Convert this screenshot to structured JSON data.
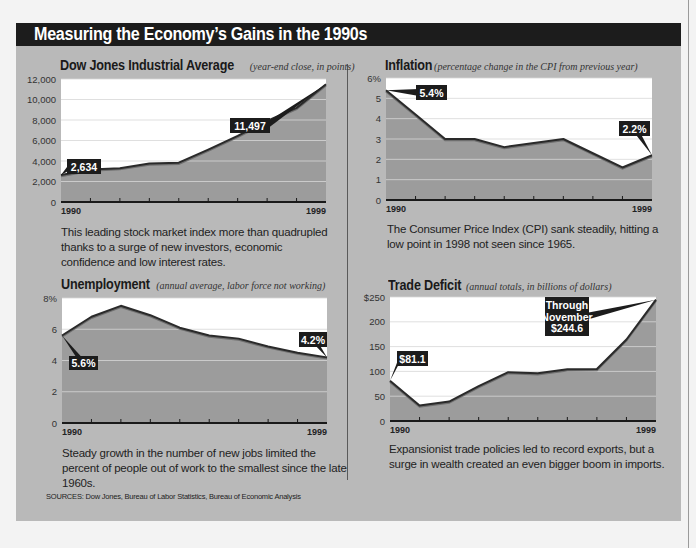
{
  "title": "Measuring the Economy’s Gains in the 1990s",
  "sources": "SOURCES: Dow Jones, Bureau of Labor Statistics, Bureau of Economic Analysis",
  "colors": {
    "panel_bg": "#b9b9b9",
    "title_bar": "#1c1c1c",
    "plot_bg": "#ffffff",
    "area_fill": "#9c9c9c",
    "line": "#2a2a2a",
    "callout_bg": "#1c1c1c",
    "callout_text": "#ffffff"
  },
  "charts": {
    "dow": {
      "heading": "Dow Jones Industrial Average",
      "subheading": "(year-end close, in points)",
      "caption": "This leading stock market index more than quadrupled thanks to a surge of new investors, economic confidence and low interest rates.",
      "x_start_label": "1990",
      "x_end_label": "1999",
      "y_ticks": [
        "0",
        "2,000",
        "4,000",
        "6,000",
        "8,000",
        "10,000",
        "12,000"
      ],
      "callouts": [
        {
          "label": "2,634",
          "point_index": 0
        },
        {
          "label": "11,497",
          "point_index": 9
        }
      ]
    },
    "inflation": {
      "heading": "Inflation",
      "subheading": "(percentage change in the CPI from previous year)",
      "caption": "The Consumer Price Index (CPI) sank steadily, hitting a low point in 1998 not seen since 1965.",
      "x_start_label": "1990",
      "x_end_label": "1999",
      "y_ticks": [
        "0",
        "1",
        "2",
        "3",
        "4",
        "5",
        "6%"
      ],
      "callouts": [
        {
          "label": "5.4%",
          "point_index": 0
        },
        {
          "label": "2.2%",
          "point_index": 9
        }
      ]
    },
    "unemployment": {
      "heading": "Unemployment",
      "subheading": "(annual average,  labor force not working)",
      "caption": "Steady growth in the number of new jobs limited the percent of people out of work to the smallest since the late 1960s.",
      "x_start_label": "1990",
      "x_end_label": "1999",
      "y_ticks": [
        "0",
        "2",
        "4",
        "6",
        "8%"
      ],
      "callouts": [
        {
          "label": "5.6%",
          "point_index": 0
        },
        {
          "label": "4.2%",
          "point_index": 9
        }
      ]
    },
    "trade": {
      "heading": "Trade Deficit",
      "subheading": "(annual totals, in billions of dollars)",
      "caption": "Expansionist trade policies led to record exports, but a surge in wealth created an even bigger boom in imports.",
      "x_start_label": "1990",
      "x_end_label": "1999",
      "y_ticks": [
        "0",
        "50",
        "100",
        "150",
        "200",
        "$250"
      ],
      "callouts": [
        {
          "label": "$81.1",
          "point_index": 0
        },
        {
          "label": "Through\nNovember\n$244.6",
          "point_index": 9
        }
      ]
    }
  },
  "chart_data": [
    {
      "type": "area",
      "title": "Dow Jones Industrial Average",
      "subtitle": "(year-end close, in points)",
      "xlabel": "",
      "ylabel": "",
      "x": [
        1990,
        1991,
        1992,
        1993,
        1994,
        1995,
        1996,
        1997,
        1998,
        1999
      ],
      "values": [
        2634,
        3169,
        3301,
        3754,
        3834,
        5117,
        6448,
        7908,
        9181,
        11497
      ],
      "ylim": [
        0,
        12000
      ],
      "y_ticks": [
        0,
        2000,
        4000,
        6000,
        8000,
        10000,
        12000
      ],
      "grid": true,
      "annotations": [
        "2,634",
        "11,497"
      ]
    },
    {
      "type": "area",
      "title": "Inflation",
      "subtitle": "(percentage change in the CPI from previous year)",
      "xlabel": "",
      "ylabel": "",
      "x": [
        1990,
        1991,
        1992,
        1993,
        1994,
        1995,
        1996,
        1997,
        1998,
        1999
      ],
      "values": [
        5.4,
        4.2,
        3.0,
        3.0,
        2.6,
        2.8,
        3.0,
        2.3,
        1.6,
        2.2
      ],
      "ylim": [
        0,
        6
      ],
      "y_ticks": [
        0,
        1,
        2,
        3,
        4,
        5,
        6
      ],
      "grid": true,
      "annotations": [
        "5.4%",
        "2.2%"
      ]
    },
    {
      "type": "area",
      "title": "Unemployment",
      "subtitle": "(annual average, labor force not working)",
      "xlabel": "",
      "ylabel": "",
      "x": [
        1990,
        1991,
        1992,
        1993,
        1994,
        1995,
        1996,
        1997,
        1998,
        1999
      ],
      "values": [
        5.6,
        6.8,
        7.5,
        6.9,
        6.1,
        5.6,
        5.4,
        4.9,
        4.5,
        4.2
      ],
      "ylim": [
        0,
        8
      ],
      "y_ticks": [
        0,
        2,
        4,
        6,
        8
      ],
      "grid": true,
      "annotations": [
        "5.6%",
        "4.2%"
      ]
    },
    {
      "type": "area",
      "title": "Trade Deficit",
      "subtitle": "(annual totals, in billions of dollars)",
      "xlabel": "",
      "ylabel": "",
      "x": [
        1990,
        1991,
        1992,
        1993,
        1994,
        1995,
        1996,
        1997,
        1998,
        1999
      ],
      "values": [
        81.1,
        31.1,
        39.2,
        70.3,
        98.5,
        96.4,
        104.3,
        104.7,
        164.3,
        244.6
      ],
      "ylim": [
        0,
        250
      ],
      "y_ticks": [
        0,
        50,
        100,
        150,
        200,
        250
      ],
      "grid": true,
      "annotations": [
        "$81.1",
        "Through November $244.6"
      ]
    }
  ]
}
